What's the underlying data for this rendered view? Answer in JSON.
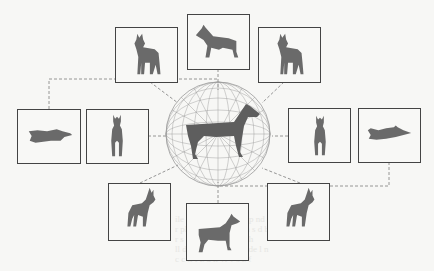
{
  "diagram": {
    "center": {
      "label": "wireframe-viewing-sphere-with-dog-model"
    },
    "views": [
      {
        "id": "top-left",
        "pose": "front-three-quarter-standing"
      },
      {
        "id": "top-center",
        "pose": "side-profile-standing"
      },
      {
        "id": "top-right",
        "pose": "front-three-quarter-standing"
      },
      {
        "id": "middle-left-outer",
        "pose": "top-down-lying"
      },
      {
        "id": "middle-left-inner",
        "pose": "front-view-standing"
      },
      {
        "id": "middle-right-inner",
        "pose": "front-view-standing"
      },
      {
        "id": "middle-right-outer",
        "pose": "top-down-lying"
      },
      {
        "id": "bottom-left",
        "pose": "front-three-quarter-standing"
      },
      {
        "id": "bottom-center",
        "pose": "side-profile-standing"
      },
      {
        "id": "bottom-right",
        "pose": "front-three-quarter-standing"
      }
    ],
    "colors": {
      "box_border": "#444444",
      "dashed_line": "#8a8a8a",
      "silhouette": "#6a6a6a",
      "wireframe": "#9a9a9a",
      "background": "#f7f7f5"
    }
  },
  "bleed_text": {
    "lines": [
      "ile ad         ra  nl  le  al  dl   n  p  nd  t  pr  ss  g",
      "     r   pl  ed  b  h  d  a  rea   Th    s  d  b",
      "   r  s  bl  h  b  w   c  v  li  s  Th  ",
      "  ll  d  b  th  v  d  ge  f  c  tr  de  l  n  ",
      "   c  c  ll  f  z  d  ll  vl  v  s  z  f  "
    ]
  }
}
